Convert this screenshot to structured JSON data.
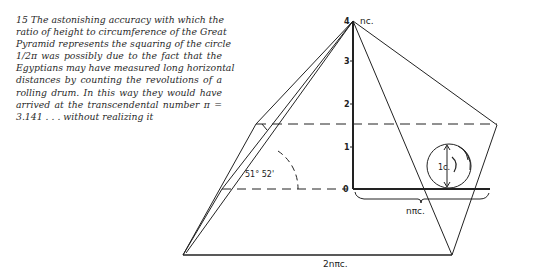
{
  "caption": {
    "number": "15",
    "lines": [
      "15 The astonishing accuracy with which the",
      "ratio of height to circumference of the Great",
      "Pyramid represents the squaring of the circle",
      "1/2π was possibly due to the fact that the",
      "Egyptians may have measured long horizontal",
      "distances by counting the revolutions of a",
      "rolling drum. In this way they would have",
      "arrived at the transcendental number π =",
      "3.141 . . . without realizing it"
    ]
  },
  "diagram": {
    "apex_label": "4 nc.",
    "apex_tick": "4",
    "apex_text": "nc.",
    "scale_ticks": [
      "3",
      "2",
      "1",
      "0"
    ],
    "angle_label": "51° 52'",
    "drum_label": "1c.",
    "half_base_label": "nπc.",
    "base_label": "2nπc.",
    "colors": {
      "ink": "#222222",
      "paper": "#ffffff"
    }
  }
}
